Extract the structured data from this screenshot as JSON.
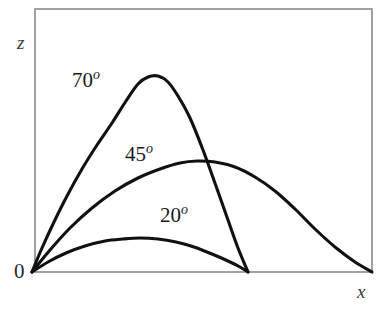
{
  "figure": {
    "background_color": "#ffffff",
    "frame_color": "#8a8a8a",
    "curve_color": "#111111",
    "width": 386,
    "height": 311
  },
  "axes": {
    "z_label": "z",
    "x_label": "x",
    "origin_label": "0",
    "frame": {
      "left": 35,
      "top": 9,
      "right": 372,
      "bottom": 272
    },
    "origin": {
      "x": 32,
      "y": 272
    }
  },
  "labels": {
    "angle_70": {
      "value": "70",
      "degree": "o"
    },
    "angle_45": {
      "value": "45",
      "degree": "o"
    },
    "angle_20": {
      "value": "20",
      "degree": "o"
    }
  },
  "chart_data": {
    "type": "line",
    "title": "",
    "subtitle": "",
    "xlabel": "x",
    "ylabel": "z",
    "grid": false,
    "legend": "inline-annotations",
    "axis_style": "box-frame-no-ticks",
    "xlim": [
      0,
      1
    ],
    "ylim": [
      0,
      1
    ],
    "series": [
      {
        "name": "70o",
        "label": "70",
        "degree_symbol": "o",
        "launch_angle_deg": 70,
        "color": "#111111",
        "range_px": 216,
        "peak_px": {
          "x": 138,
          "y": 76
        },
        "peak_height_rel": 0.745,
        "range_rel": 0.636,
        "label_position_px": {
          "x": 72,
          "y": 68
        },
        "points_px": [
          [
            32,
            272
          ],
          [
            42,
            248
          ],
          [
            54,
            222
          ],
          [
            67,
            196
          ],
          [
            82,
            169
          ],
          [
            97,
            145
          ],
          [
            112,
            123
          ],
          [
            126,
            101
          ],
          [
            138,
            84
          ],
          [
            148,
            77
          ],
          [
            158,
            76
          ],
          [
            168,
            82
          ],
          [
            178,
            96
          ],
          [
            190,
            118
          ],
          [
            203,
            150
          ],
          [
            216,
            186
          ],
          [
            228,
            220
          ],
          [
            238,
            248
          ],
          [
            248,
            272
          ]
        ]
      },
      {
        "name": "45o",
        "label": "45",
        "degree_symbol": "o",
        "launch_angle_deg": 45,
        "color": "#111111",
        "range_px": 340,
        "peak_px": {
          "x": 197,
          "y": 161
        },
        "peak_height_rel": 0.422,
        "range_rel": 1.0,
        "label_position_px": {
          "x": 125,
          "y": 142
        },
        "points_px": [
          [
            32,
            272
          ],
          [
            50,
            250
          ],
          [
            70,
            228
          ],
          [
            92,
            208
          ],
          [
            115,
            191
          ],
          [
            138,
            178
          ],
          [
            160,
            169
          ],
          [
            180,
            163
          ],
          [
            197,
            161
          ],
          [
            215,
            162
          ],
          [
            235,
            167
          ],
          [
            255,
            177
          ],
          [
            275,
            191
          ],
          [
            295,
            209
          ],
          [
            315,
            229
          ],
          [
            335,
            247
          ],
          [
            355,
            262
          ],
          [
            372,
            272
          ]
        ]
      },
      {
        "name": "20o",
        "label": "20",
        "degree_symbol": "o",
        "launch_angle_deg": 20,
        "color": "#111111",
        "range_px": 216,
        "peak_px": {
          "x": 140,
          "y": 238
        },
        "peak_height_rel": 0.129,
        "range_rel": 0.636,
        "label_position_px": {
          "x": 160,
          "y": 203
        },
        "points_px": [
          [
            32,
            272
          ],
          [
            48,
            262
          ],
          [
            66,
            253
          ],
          [
            85,
            246
          ],
          [
            105,
            241
          ],
          [
            123,
            239
          ],
          [
            140,
            238
          ],
          [
            158,
            239
          ],
          [
            176,
            242
          ],
          [
            194,
            247
          ],
          [
            212,
            254
          ],
          [
            228,
            261
          ],
          [
            240,
            267
          ],
          [
            248,
            272
          ]
        ]
      }
    ]
  }
}
